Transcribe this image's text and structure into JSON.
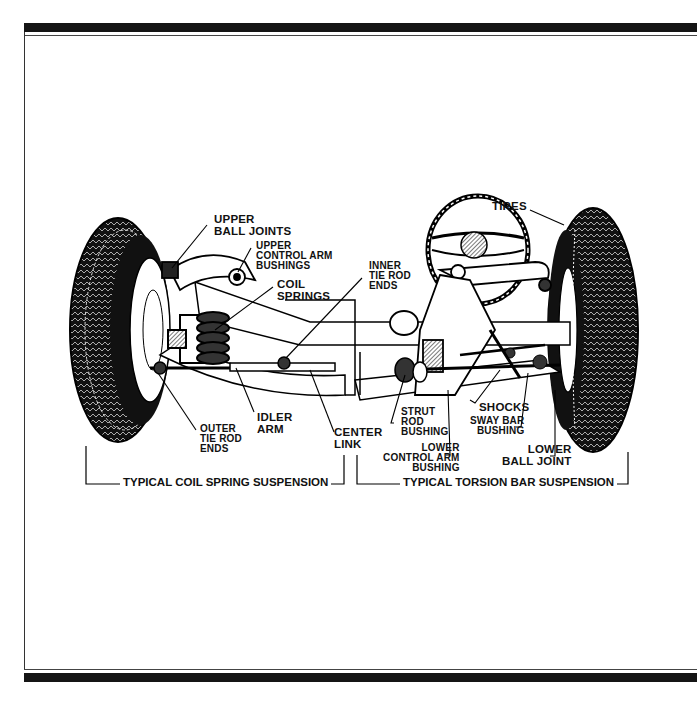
{
  "diagram": {
    "frame": {
      "bar_color": "#151515",
      "line_color": "#444444",
      "background": "#ffffff"
    },
    "labels": {
      "upper_ball_joints": "UPPER\nBALL JOINTS",
      "upper_control_arm_bushings": "UPPER\nCONTROL ARM\nBUSHINGS",
      "coil_springs": "COIL\nSPRINGS",
      "inner_tie_rod_ends": "INNER\nTIE ROD\nENDS",
      "tires": "TIRES",
      "outer_tie_rod_ends": "OUTER\nTIE ROD\nENDS",
      "idler_arm": "IDLER\nARM",
      "center_link": "CENTER\nLINK",
      "strut_rod_bushing": "STRUT\nROD\nBUSHING",
      "shocks": "SHOCKS",
      "sway_bar_bushing": "SWAY BAR\nBUSHING",
      "lower_control_arm_bushing": "LOWER\nCONTROL ARM\nBUSHING",
      "lower_ball_joint": "LOWER\nBALL JOINT"
    },
    "captions": {
      "left": "TYPICAL COIL SPRING SUSPENSION",
      "right": "TYPICAL TORSION BAR SUSPENSION"
    }
  }
}
